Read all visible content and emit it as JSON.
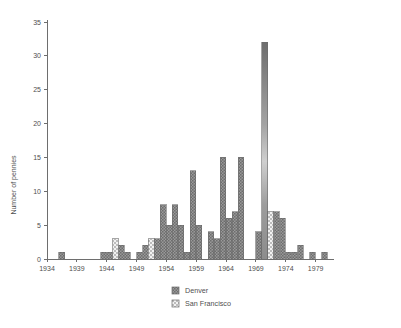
{
  "chart_data": {
    "type": "bar",
    "title": "",
    "subtitle": "",
    "xlabel": "",
    "ylabel": "Number of pennies",
    "xlim": [
      1934,
      1982
    ],
    "ylim": [
      0,
      35
    ],
    "grid": false,
    "legend_position": "bottom-center",
    "x_ticks": [
      "1934",
      "1939",
      "1944",
      "1949",
      "1954",
      "1959",
      "1964",
      "1969",
      "1974",
      "1979"
    ],
    "x_tick_values": [
      1934,
      1939,
      1944,
      1949,
      1954,
      1959,
      1964,
      1969,
      1974,
      1979
    ],
    "y_ticks": [
      "0",
      "5",
      "10",
      "15",
      "20",
      "25",
      "30",
      "35"
    ],
    "y_tick_values": [
      0,
      5,
      10,
      15,
      20,
      25,
      30,
      35
    ],
    "categories": [
      1934,
      1935,
      1936,
      1937,
      1938,
      1939,
      1940,
      1941,
      1942,
      1943,
      1944,
      1945,
      1946,
      1947,
      1948,
      1949,
      1950,
      1951,
      1952,
      1953,
      1954,
      1955,
      1956,
      1957,
      1958,
      1959,
      1960,
      1961,
      1962,
      1963,
      1964,
      1965,
      1966,
      1967,
      1968,
      1969,
      1970,
      1971,
      1972,
      1973,
      1974,
      1975,
      1976,
      1977,
      1978,
      1979,
      1980
    ],
    "series": [
      {
        "name": "Denver",
        "color": "#8a8a8a",
        "pattern": "dense-hatch",
        "values": [
          0,
          0,
          1,
          0,
          0,
          0,
          0,
          0,
          0,
          1,
          1,
          1,
          2,
          1,
          0,
          1,
          2,
          2,
          3,
          8,
          5,
          8,
          5,
          1,
          13,
          5,
          0,
          4,
          3,
          15,
          6,
          7,
          15,
          0,
          0,
          4,
          32,
          6,
          7,
          6,
          1,
          1,
          2,
          0,
          1,
          0,
          1
        ]
      },
      {
        "name": "San Francisco",
        "color": "#dcdcdc",
        "pattern": "checker",
        "values": [
          0,
          0,
          0,
          0,
          0,
          0,
          0,
          0,
          0,
          0,
          0,
          3,
          0,
          0,
          0,
          0,
          0,
          0,
          3,
          0,
          0,
          0,
          0,
          0,
          0,
          0,
          0,
          0,
          0,
          0,
          0,
          0,
          0,
          0,
          0,
          0,
          7,
          0,
          0,
          0,
          0,
          0,
          0,
          0,
          0,
          0,
          0
        ]
      }
    ],
    "bars": [
      {
        "year": 1936,
        "value": 1,
        "series": "Denver"
      },
      {
        "year": 1943,
        "value": 1,
        "series": "Denver"
      },
      {
        "year": 1944,
        "value": 1,
        "series": "Denver"
      },
      {
        "year": 1945,
        "value": 3,
        "series": "San Francisco"
      },
      {
        "year": 1946,
        "value": 2,
        "series": "Denver"
      },
      {
        "year": 1947,
        "value": 1,
        "series": "Denver"
      },
      {
        "year": 1949,
        "value": 1,
        "series": "Denver"
      },
      {
        "year": 1950,
        "value": 2,
        "series": "Denver"
      },
      {
        "year": 1951,
        "value": 3,
        "series": "San Francisco"
      },
      {
        "year": 1952,
        "value": 3,
        "series": "Denver"
      },
      {
        "year": 1953,
        "value": 8,
        "series": "Denver"
      },
      {
        "year": 1954,
        "value": 5,
        "series": "Denver"
      },
      {
        "year": 1955,
        "value": 8,
        "series": "Denver"
      },
      {
        "year": 1956,
        "value": 5,
        "series": "Denver"
      },
      {
        "year": 1957,
        "value": 1,
        "series": "Denver"
      },
      {
        "year": 1958,
        "value": 13,
        "series": "Denver"
      },
      {
        "year": 1959,
        "value": 5,
        "series": "Denver"
      },
      {
        "year": 1961,
        "value": 4,
        "series": "Denver"
      },
      {
        "year": 1962,
        "value": 3,
        "series": "Denver"
      },
      {
        "year": 1963,
        "value": 15,
        "series": "Denver"
      },
      {
        "year": 1964,
        "value": 6,
        "series": "Denver"
      },
      {
        "year": 1965,
        "value": 7,
        "series": "Denver"
      },
      {
        "year": 1966,
        "value": 15,
        "series": "Denver"
      },
      {
        "year": 1969,
        "value": 4,
        "series": "Denver"
      },
      {
        "year": 1970,
        "value": 32,
        "series": "Denver"
      },
      {
        "year": 1971,
        "value": 7,
        "series": "San Francisco"
      },
      {
        "year": 1972,
        "value": 7,
        "series": "Denver"
      },
      {
        "year": 1973,
        "value": 6,
        "series": "Denver"
      },
      {
        "year": 1974,
        "value": 1,
        "series": "Denver"
      },
      {
        "year": 1975,
        "value": 1,
        "series": "Denver"
      },
      {
        "year": 1976,
        "value": 2,
        "series": "Denver"
      },
      {
        "year": 1978,
        "value": 1,
        "series": "Denver"
      },
      {
        "year": 1980,
        "value": 1,
        "series": "Denver"
      }
    ],
    "legend": [
      {
        "label": "Denver",
        "swatch": "dense-hatch",
        "color": "#8a8a8a"
      },
      {
        "label": "San Francisco",
        "swatch": "checker",
        "color": "#dcdcdc"
      }
    ]
  }
}
